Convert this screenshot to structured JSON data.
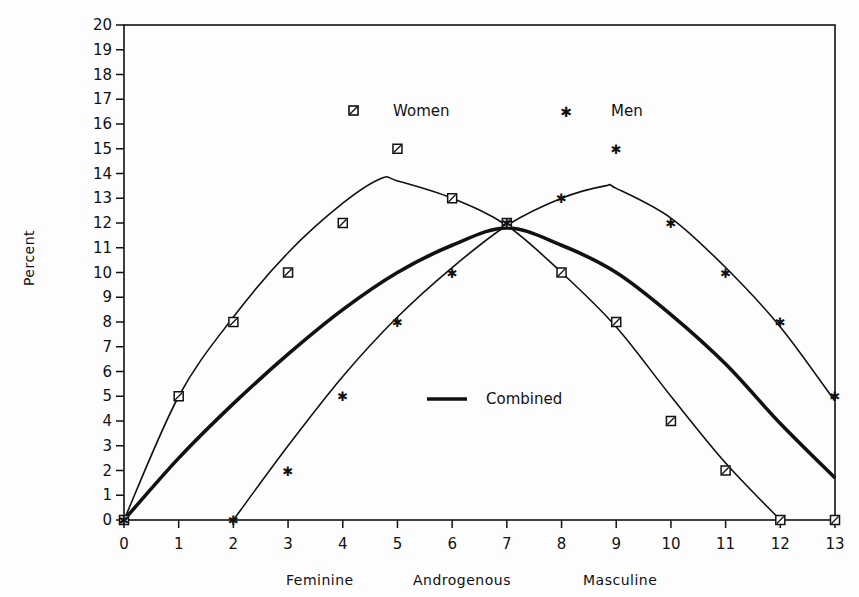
{
  "chart_data": {
    "type": "line",
    "title": "",
    "xlabel": "Feminine     Androgenous     Masculine",
    "xlabel_parts": [
      "Feminine",
      "Androgenous",
      "Masculine"
    ],
    "ylabel": "Percent",
    "xlim": [
      0,
      13
    ],
    "ylim": [
      0,
      20
    ],
    "x_ticks": [
      0,
      1,
      2,
      3,
      4,
      5,
      6,
      7,
      8,
      9,
      10,
      11,
      12,
      13
    ],
    "y_ticks": [
      0,
      1,
      2,
      3,
      4,
      5,
      6,
      7,
      8,
      9,
      10,
      11,
      12,
      13,
      14,
      15,
      16,
      17,
      18,
      19,
      20
    ],
    "grid": false,
    "legend": [
      {
        "label": "Women",
        "marker": "square-slash"
      },
      {
        "label": "Men",
        "marker": "star"
      },
      {
        "label": "Combined",
        "marker": "thick-line"
      }
    ],
    "series": [
      {
        "name": "Women",
        "kind": "scatter",
        "marker": "square-slash",
        "x": [
          0,
          1,
          2,
          3,
          4,
          5,
          6,
          7,
          8,
          9,
          10,
          11,
          12,
          13
        ],
        "values": [
          0,
          5,
          8,
          10,
          12,
          15,
          13,
          12,
          10,
          8,
          4,
          2,
          0,
          0
        ]
      },
      {
        "name": "Men",
        "kind": "scatter",
        "marker": "star",
        "x": [
          0,
          2,
          3,
          4,
          5,
          6,
          7,
          8,
          9,
          10,
          11,
          12,
          13
        ],
        "values": [
          0,
          0,
          2,
          5,
          8,
          10,
          12,
          13,
          15,
          12,
          10,
          8,
          5
        ]
      },
      {
        "name": "Women fit",
        "kind": "curve",
        "x": [
          0,
          1,
          2,
          3,
          4,
          4.7,
          5,
          6,
          7,
          8,
          9,
          10,
          11,
          12
        ],
        "values": [
          0,
          5,
          8.2,
          10.8,
          12.8,
          13.8,
          13.7,
          13.0,
          11.9,
          10.0,
          7.8,
          5.0,
          2.3,
          0
        ]
      },
      {
        "name": "Men fit",
        "kind": "curve",
        "x": [
          2,
          3,
          4,
          5,
          6,
          7,
          8,
          8.8,
          9,
          10,
          11,
          12,
          13
        ],
        "values": [
          0,
          3.0,
          5.8,
          8.2,
          10.2,
          11.9,
          13.0,
          13.5,
          13.4,
          12.2,
          10.2,
          7.8,
          4.8
        ]
      },
      {
        "name": "Combined",
        "kind": "curve",
        "thick": true,
        "x": [
          0,
          1,
          2,
          3,
          4,
          5,
          6,
          7,
          8,
          9,
          10,
          11,
          12,
          13
        ],
        "values": [
          0,
          2.5,
          4.7,
          6.7,
          8.5,
          10.0,
          11.1,
          11.8,
          11.1,
          10.0,
          8.3,
          6.3,
          3.9,
          1.7
        ]
      }
    ]
  }
}
